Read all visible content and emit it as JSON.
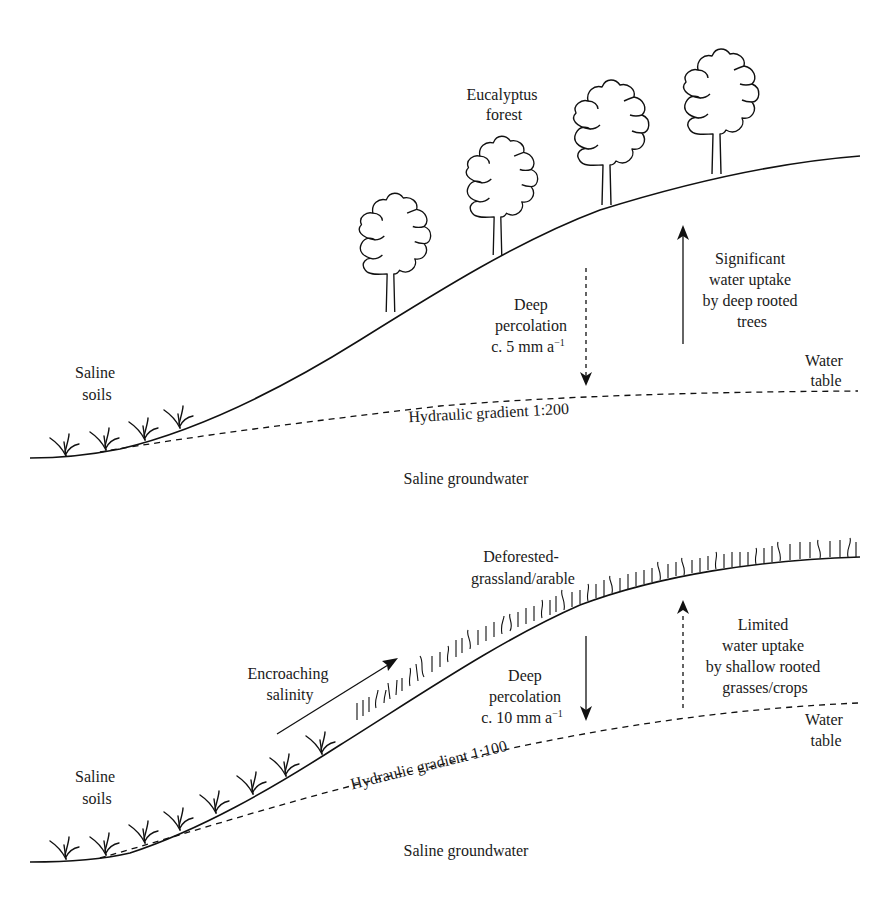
{
  "top_panel": {
    "labels": {
      "eucalyptus_line1": "Eucalyptus",
      "eucalyptus_line2": "forest",
      "saline_soils_line1": "Saline",
      "saline_soils_line2": "soils",
      "deep_perc_line1": "Deep",
      "deep_perc_line2": "percolation",
      "deep_perc_line3": "c. 5 mm a",
      "deep_perc_sup": "−1",
      "uptake_line1": "Significant",
      "uptake_line2": "water uptake",
      "uptake_line3": "by deep rooted",
      "uptake_line4": "trees",
      "water_table_line1": "Water",
      "water_table_line2": "table",
      "hydraulic_gradient": "Hydraulic gradient 1:200",
      "saline_groundwater": "Saline groundwater"
    },
    "percolation_rate_mm_per_year": 5,
    "hydraulic_gradient_ratio": "1:200",
    "trees": 4,
    "saline_plants": 4
  },
  "bottom_panel": {
    "labels": {
      "deforested_line1": "Deforested-",
      "deforested_line2": "grassland/arable",
      "encroaching_line1": "Encroaching",
      "encroaching_line2": "salinity",
      "saline_soils_line1": "Saline",
      "saline_soils_line2": "soils",
      "deep_perc_line1": "Deep",
      "deep_perc_line2": "percolation",
      "deep_perc_line3": "c. 10 mm a",
      "deep_perc_sup": "−1",
      "uptake_line1": "Limited",
      "uptake_line2": "water uptake",
      "uptake_line3": "by shallow rooted",
      "uptake_line4": "grasses/crops",
      "water_table_line1": "Water",
      "water_table_line2": "table",
      "hydraulic_gradient": "Hydraulic gradient 1:100",
      "saline_groundwater": "Saline groundwater"
    },
    "percolation_rate_mm_per_year": 10,
    "hydraulic_gradient_ratio": "1:100",
    "saline_plants": 9
  },
  "colors": {
    "line": "#111111",
    "background": "#ffffff",
    "text": "#1a1a1a"
  }
}
